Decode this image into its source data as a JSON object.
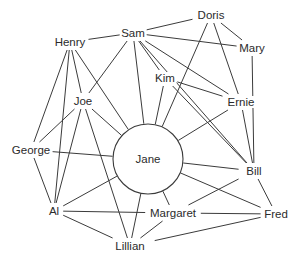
{
  "diagram": {
    "type": "social-network-graph",
    "title": "",
    "style": {
      "background": "#ffffff",
      "edge_color": "#3b3b3b",
      "label_color": "#2b2b2b",
      "hub_fill": "#ffffff"
    },
    "hub": {
      "id": "jane",
      "label": "Jane",
      "x": 148,
      "y": 159,
      "radius": 35
    },
    "nodes": [
      {
        "id": "doris",
        "label": "Doris",
        "x": 211,
        "y": 15,
        "shape": "text"
      },
      {
        "id": "sam",
        "label": "Sam",
        "x": 133,
        "y": 33,
        "shape": "text"
      },
      {
        "id": "mary",
        "label": "Mary",
        "x": 252,
        "y": 48,
        "shape": "text"
      },
      {
        "id": "henry",
        "label": "Henry",
        "x": 70,
        "y": 42,
        "shape": "text"
      },
      {
        "id": "kim",
        "label": "Kim",
        "x": 165,
        "y": 78,
        "shape": "text"
      },
      {
        "id": "joe",
        "label": "Joe",
        "x": 83,
        "y": 101,
        "shape": "text"
      },
      {
        "id": "ernie",
        "label": "Ernie",
        "x": 241,
        "y": 102,
        "shape": "text"
      },
      {
        "id": "george",
        "label": "George",
        "x": 31,
        "y": 150,
        "shape": "text"
      },
      {
        "id": "jane",
        "label": "Jane",
        "x": 148,
        "y": 159,
        "shape": "circle"
      },
      {
        "id": "bill",
        "label": "Bill",
        "x": 254,
        "y": 171,
        "shape": "text"
      },
      {
        "id": "al",
        "label": "Al",
        "x": 54,
        "y": 211,
        "shape": "text"
      },
      {
        "id": "margaret",
        "label": "Margaret",
        "x": 173,
        "y": 213,
        "shape": "text"
      },
      {
        "id": "fred",
        "label": "Fred",
        "x": 276,
        "y": 214,
        "shape": "text"
      },
      {
        "id": "lillian",
        "label": "Lillian",
        "x": 130,
        "y": 246,
        "shape": "text"
      }
    ],
    "edges": [
      {
        "from": "sam",
        "to": "doris"
      },
      {
        "from": "doris",
        "to": "mary"
      },
      {
        "from": "doris",
        "to": "ernie"
      },
      {
        "from": "doris",
        "to": "jane"
      },
      {
        "from": "sam",
        "to": "mary"
      },
      {
        "from": "sam",
        "to": "henry"
      },
      {
        "from": "sam",
        "to": "kim"
      },
      {
        "from": "sam",
        "to": "joe"
      },
      {
        "from": "sam",
        "to": "jane"
      },
      {
        "from": "sam",
        "to": "ernie"
      },
      {
        "from": "sam",
        "to": "bill"
      },
      {
        "from": "mary",
        "to": "bill"
      },
      {
        "from": "kim",
        "to": "jane"
      },
      {
        "from": "kim",
        "to": "ernie"
      },
      {
        "from": "kim",
        "to": "bill"
      },
      {
        "from": "ernie",
        "to": "jane"
      },
      {
        "from": "ernie",
        "to": "bill"
      },
      {
        "from": "henry",
        "to": "joe"
      },
      {
        "from": "henry",
        "to": "george"
      },
      {
        "from": "henry",
        "to": "al"
      },
      {
        "from": "henry",
        "to": "jane"
      },
      {
        "from": "joe",
        "to": "george"
      },
      {
        "from": "joe",
        "to": "jane"
      },
      {
        "from": "joe",
        "to": "al"
      },
      {
        "from": "joe",
        "to": "lillian"
      },
      {
        "from": "george",
        "to": "jane"
      },
      {
        "from": "george",
        "to": "al"
      },
      {
        "from": "jane",
        "to": "al"
      },
      {
        "from": "jane",
        "to": "margaret"
      },
      {
        "from": "jane",
        "to": "lillian"
      },
      {
        "from": "jane",
        "to": "bill"
      },
      {
        "from": "jane",
        "to": "fred"
      },
      {
        "from": "al",
        "to": "margaret"
      },
      {
        "from": "al",
        "to": "lillian"
      },
      {
        "from": "margaret",
        "to": "lillian"
      },
      {
        "from": "margaret",
        "to": "fred"
      },
      {
        "from": "margaret",
        "to": "bill"
      },
      {
        "from": "bill",
        "to": "fred"
      },
      {
        "from": "lillian",
        "to": "fred"
      }
    ]
  }
}
